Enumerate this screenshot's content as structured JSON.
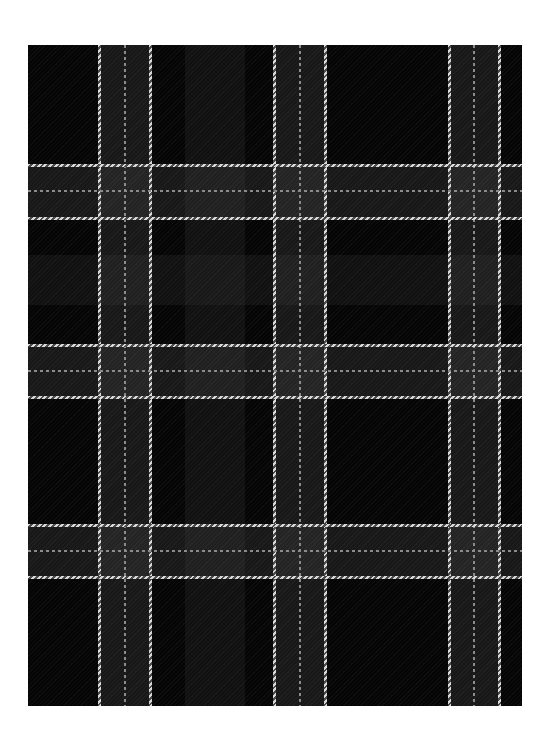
{
  "image": {
    "subject": "tartan plaid fabric swatch",
    "colors": {
      "background": "#ffffff",
      "base": "#050505",
      "band": "#2a2a2a",
      "stripe_light": "#d8d8d8",
      "stripe_dark": "#4a4a4a",
      "thin_stripe": "#8a8a8a"
    },
    "fabric": {
      "left": 28,
      "top": 45,
      "width": 494,
      "height": 661
    },
    "vertical_groups": [
      {
        "outer_left": 71,
        "center": 96,
        "outer_right": 122
      },
      {
        "outer_left": 246,
        "center": 271,
        "outer_right": 297
      },
      {
        "outer_left": 421,
        "center": 445,
        "outer_right": 471
      }
    ],
    "horizontal_groups": [
      {
        "outer_top": 120,
        "center": 145,
        "outer_bottom": 173
      },
      {
        "outer_top": 300,
        "center": 325,
        "outer_bottom": 352
      },
      {
        "outer_top": 480,
        "center": 505,
        "outer_bottom": 532
      }
    ],
    "faint_bands": {
      "vertical": [
        {
          "left": 157,
          "width": 60
        }
      ],
      "horizontal": [
        {
          "top": 210,
          "height": 50
        }
      ]
    }
  }
}
